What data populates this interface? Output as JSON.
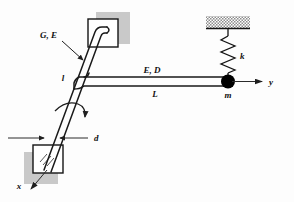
{
  "figure": {
    "background_color": "#fdfdfd",
    "line_color": "#1a1a1a",
    "shadow_color": "#c9c9c9",
    "mass_color": "#000000"
  },
  "labels": {
    "shaft_material": "G, E",
    "shaft_length": "l",
    "shaft_diameter": "d",
    "beam_material": "E, D",
    "beam_length": "L",
    "spring_constant": "k",
    "mass": "m",
    "axis_x": "x",
    "axis_y": "y"
  },
  "elements": {
    "top_support_block": "fixed-support-upper",
    "bottom_support_block": "fixed-support-lower",
    "ceiling_hatch": "fixed-ceiling",
    "spring": "helical-spring",
    "mass_point": "lumped-mass",
    "torsion_arrow": "rotation-direction-arrow",
    "dimension_arrows": "diameter-dimension"
  }
}
